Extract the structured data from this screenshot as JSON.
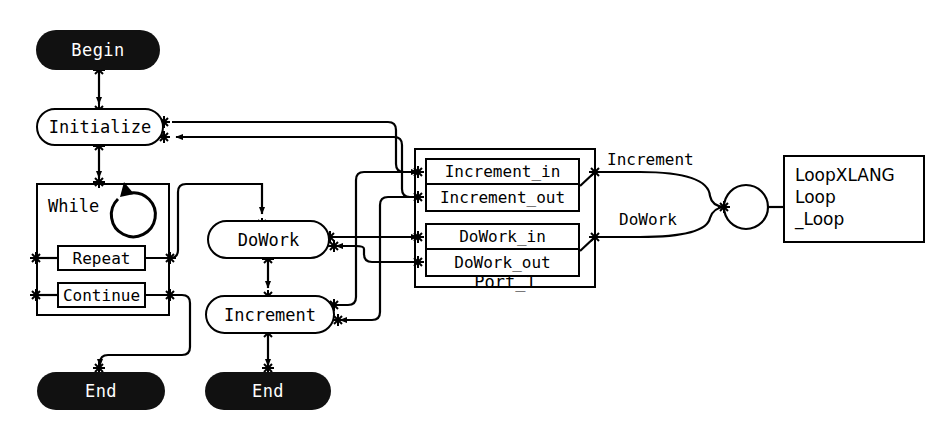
{
  "diagram": {
    "nodes": {
      "begin": "Begin",
      "initialize": "Initialize",
      "while_label": "While",
      "while_icon": "loop-circular-arrow-icon",
      "repeat": "Repeat",
      "continue": "Continue",
      "dowork": "DoWork",
      "increment": "Increment",
      "end_left": "End",
      "end_middle": "End"
    },
    "port": {
      "name": "Port_1",
      "increment_in": "Increment_in",
      "increment_out": "Increment_out",
      "dowork_in": "DoWork_in",
      "dowork_out": "DoWork_out"
    },
    "edge_labels": {
      "increment": "Increment",
      "dowork": "DoWork"
    },
    "service": {
      "line1": "LoopXLANG",
      "line2": "Loop",
      "line3": "_Loop"
    },
    "colors": {
      "terminal_fill": "#111111",
      "terminal_text": "#ffffff",
      "stroke": "#000000",
      "background": "#ffffff"
    }
  }
}
